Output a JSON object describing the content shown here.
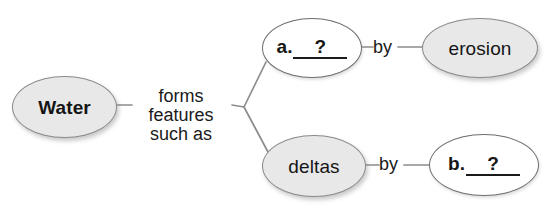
{
  "diagram": {
    "type": "concept-map",
    "nodes": [
      {
        "id": "water",
        "label": "Water",
        "style": "shaded",
        "bold": true
      },
      {
        "id": "blank_a",
        "prefix": "a.",
        "slot": "?",
        "style": "blank"
      },
      {
        "id": "erosion",
        "label": "erosion",
        "style": "shaded",
        "bold": false
      },
      {
        "id": "deltas",
        "label": "deltas",
        "style": "shaded",
        "bold": false
      },
      {
        "id": "blank_b",
        "prefix": "b.",
        "slot": "?",
        "style": "blank"
      }
    ],
    "edge_labels": {
      "root": "forms\nfeatures\nsuch as",
      "root_line1": "forms",
      "root_line2": "features",
      "root_line3": "such as",
      "by_top": "by",
      "by_bottom": "by"
    },
    "colors": {
      "node_fill_shaded": "#e8e8e8",
      "node_fill_blank": "#ffffff",
      "node_stroke": "#8a8a8a",
      "edge_stroke": "#8c8c8c",
      "text": "#151515",
      "background": "#ffffff"
    }
  }
}
